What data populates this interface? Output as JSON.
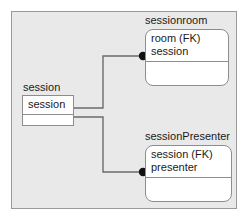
{
  "diagram": {
    "type": "entity-relationship-diagram",
    "background_color": "#e9e9e9",
    "border_color": "#9a9a9a",
    "entity_fill": "#ffffff",
    "entity_border": "#8d8d8d",
    "connector_color": "#6b6b6b",
    "endpoint_color": "#111111",
    "entities": [
      {
        "id": "sessionroom",
        "title": "sessionroom",
        "shape": "rounded-rectangle",
        "attributes": [
          "room (FK)",
          "session"
        ],
        "has_empty_section": true
      },
      {
        "id": "session",
        "title": "session",
        "shape": "rectangle",
        "attributes": [
          "session"
        ],
        "has_empty_section": true
      },
      {
        "id": "sessionPresenter",
        "title": "sessionPresenter",
        "shape": "rounded-rectangle",
        "attributes": [
          "session (FK)",
          "presenter"
        ],
        "has_empty_section": true
      }
    ],
    "relationships": [
      {
        "from": "session",
        "to": "sessionroom",
        "endpoint_marker": "filled-circle",
        "routing": "orthogonal"
      },
      {
        "from": "session",
        "to": "sessionPresenter",
        "endpoint_marker": "filled-circle",
        "routing": "orthogonal"
      }
    ]
  }
}
